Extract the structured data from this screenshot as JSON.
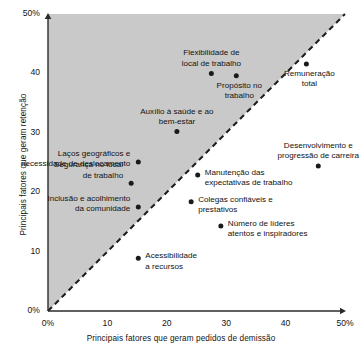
{
  "chart_data": {
    "type": "scatter",
    "title": "",
    "xlabel": "Principais fatores que geram pedidos de demissão",
    "ylabel": "Principais fatores que geram retenção",
    "xlim": [
      0,
      50
    ],
    "ylim": [
      0,
      50
    ],
    "xticks": [
      "0%",
      "10",
      "20",
      "30",
      "40",
      "50%"
    ],
    "xtick_values": [
      0,
      10,
      20,
      30,
      40,
      50
    ],
    "yticks": [
      "0%",
      "10",
      "20",
      "30",
      "40",
      "50%"
    ],
    "ytick_values": [
      0,
      10,
      20,
      30,
      40,
      50
    ],
    "grid": false,
    "legend": "none",
    "annotations": [
      {
        "name": "diagonal-reference-line",
        "style": "dashed",
        "from": [
          0,
          0
        ],
        "to": [
          50,
          50
        ]
      },
      {
        "name": "shaded-retention-region",
        "description": "gray fill above the diagonal line"
      }
    ],
    "points": [
      {
        "label": "Flexibilidade de\nlocal de trabalho",
        "x": 27.5,
        "y": 40.0,
        "label_pos": "above",
        "align": "center",
        "label_dx": 0,
        "label_dy": -25
      },
      {
        "label": "Propósito no\ntrabalho",
        "x": 31.7,
        "y": 39.6,
        "label_pos": "below",
        "align": "center",
        "label_dx": 3,
        "label_dy": 5
      },
      {
        "label": "Remuneração\ntotal",
        "x": 43.5,
        "y": 41.6,
        "label_pos": "below",
        "align": "center",
        "label_dx": 3,
        "label_dy": 5
      },
      {
        "label": "Auxílio à saúde e ao\nbem-estar",
        "x": 21.7,
        "y": 30.2,
        "label_pos": "above",
        "align": "center",
        "label_dx": 0,
        "label_dy": -25
      },
      {
        "label": "Laços geográficos e\nnecessidade de deslocamento",
        "x": 15.2,
        "y": 25.1,
        "label_pos": "left",
        "align": "right",
        "label_dx": -8,
        "label_dy": -13
      },
      {
        "label": "Segurança no local\nde trabalho",
        "x": 14.0,
        "y": 21.5,
        "label_pos": "left",
        "align": "right",
        "label_dx": -8,
        "label_dy": -23
      },
      {
        "label": "Inclusão e acolhimento\nda comunidade",
        "x": 15.2,
        "y": 17.5,
        "label_pos": "left",
        "align": "right",
        "label_dx": -8,
        "label_dy": -13
      },
      {
        "label": "Desenvolvimento e\nprogressão de carreira",
        "x": 45.5,
        "y": 24.4,
        "label_pos": "above",
        "align": "center",
        "label_dx": 0,
        "label_dy": -25
      },
      {
        "label": "Manutenção das\nexpectativas de trabalho",
        "x": 25.2,
        "y": 22.9,
        "label_pos": "right",
        "align": "left",
        "label_dx": 7,
        "label_dy": -7
      },
      {
        "label": "Colegas confiáveis e\nprestativos",
        "x": 24.1,
        "y": 18.4,
        "label_pos": "right",
        "align": "left",
        "label_dx": 7,
        "label_dy": -7
      },
      {
        "label": "Número de líderes\natentos e inspiradores",
        "x": 29.1,
        "y": 14.3,
        "label_pos": "right",
        "align": "left",
        "label_dx": 7,
        "label_dy": -7
      },
      {
        "label": "Acessibilidade\na recursos",
        "x": 15.2,
        "y": 8.9,
        "label_pos": "right",
        "align": "left",
        "label_dx": 7,
        "label_dy": -7
      }
    ],
    "colors": {
      "point": "#1a1a1a",
      "shaded_region": "#c9c9c9",
      "axis": "#2b2b2b",
      "dashed_line": "#1f1f1f",
      "background": "#ffffff"
    }
  }
}
